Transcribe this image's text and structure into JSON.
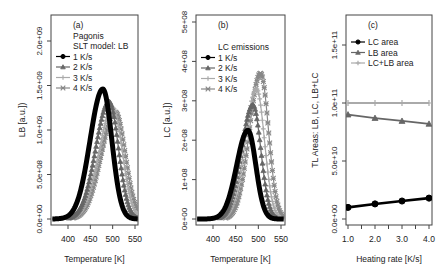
{
  "chart_data": [
    {
      "panel": "a",
      "type": "line",
      "title": "",
      "legend_title": [
        "(a)",
        "Pagonis",
        "SLT model: LB"
      ],
      "xlabel": "Temperature [K]",
      "ylabel": "LB [a.u.])",
      "xlim": [
        365,
        555
      ],
      "ylim": [
        0,
        2400000000.0
      ],
      "xticks": [
        400,
        450,
        500,
        550
      ],
      "yticks": [
        "0.0e+00",
        "5.0e+08",
        "1.0e+09",
        "1.5e+09",
        "2.0e+09"
      ],
      "ytick_values": [
        0,
        500000000.0,
        1000000000.0,
        1500000000.0,
        2000000000.0
      ],
      "legend_position": "top-left",
      "series": [
        {
          "name": "1 K/s",
          "marker": "circle",
          "color": "#000000",
          "peak_x": 478,
          "peak_y": 1460000000.0,
          "width": 30
        },
        {
          "name": "2 K/s",
          "marker": "triangle",
          "color": "#666666",
          "peak_x": 492,
          "peak_y": 1320000000.0,
          "width": 31
        },
        {
          "name": "3 K/s",
          "marker": "plus",
          "color": "#aaaaaa",
          "peak_x": 500,
          "peak_y": 1250000000.0,
          "width": 32
        },
        {
          "name": "4 K/s",
          "marker": "x",
          "color": "#888888",
          "peak_x": 506,
          "peak_y": 1200000000.0,
          "width": 33
        }
      ]
    },
    {
      "panel": "b",
      "type": "line",
      "legend_title": [
        "(b)",
        "LC emissions"
      ],
      "xlabel": "Temperature [K]",
      "ylabel": "LC [a.u.])",
      "xlim": [
        365,
        555
      ],
      "ylim": [
        0,
        520000000.0
      ],
      "xticks": [
        400,
        450,
        500,
        550
      ],
      "yticks": [
        "0e+00",
        "1e+08",
        "2e+08",
        "3e+08",
        "4e+08",
        "5e+08"
      ],
      "ytick_values": [
        0,
        100000000.0,
        200000000.0,
        300000000.0,
        400000000.0,
        500000000.0
      ],
      "legend_position": "top-left",
      "series": [
        {
          "name": "1 K/s",
          "marker": "circle",
          "color": "#000000",
          "peak_x": 477,
          "peak_y": 225000000.0,
          "width": 26
        },
        {
          "name": "2 K/s",
          "marker": "triangle",
          "color": "#666666",
          "peak_x": 488,
          "peak_y": 290000000.0,
          "width": 26
        },
        {
          "name": "3 K/s",
          "marker": "plus",
          "color": "#aaaaaa",
          "peak_x": 496,
          "peak_y": 330000000.0,
          "width": 26
        },
        {
          "name": "4 K/s",
          "marker": "x",
          "color": "#888888",
          "peak_x": 505,
          "peak_y": 370000000.0,
          "width": 26
        }
      ]
    },
    {
      "panel": "c",
      "type": "line",
      "legend_title": [
        "(c)"
      ],
      "xlabel": "Heating rate [K/s]",
      "ylabel": "TL Areas: LB,  LC,  LB+LC",
      "xlim": [
        0.95,
        4.1
      ],
      "ylim": [
        -10000000000.0,
        180000000000.0
      ],
      "xticks": [
        "1.0",
        "2.0",
        "3.0",
        "4.0"
      ],
      "xtick_values": [
        1,
        2,
        3,
        4
      ],
      "yticks": [
        "0.0e+00",
        "5.0e+10",
        "1.0e+11",
        "1.5e+11"
      ],
      "ytick_values": [
        0,
        50000000000.0,
        100000000000.0,
        150000000000.0
      ],
      "legend_position": "top-left",
      "categories": [
        1,
        2,
        3,
        4
      ],
      "series": [
        {
          "name": "LC area",
          "marker": "circle",
          "color": "#000000",
          "values": [
            10000000000.0,
            13000000000.0,
            15500000000.0,
            18000000000.0
          ]
        },
        {
          "name": "LB area",
          "marker": "triangle",
          "color": "#666666",
          "values": [
            90000000000.0,
            87000000000.0,
            84500000000.0,
            82000000000.0
          ]
        },
        {
          "name": "LC+LB area",
          "marker": "plus",
          "color": "#aaaaaa",
          "values": [
            100000000000.0,
            100000000000.0,
            100000000000.0,
            100000000000.0
          ]
        }
      ]
    }
  ]
}
